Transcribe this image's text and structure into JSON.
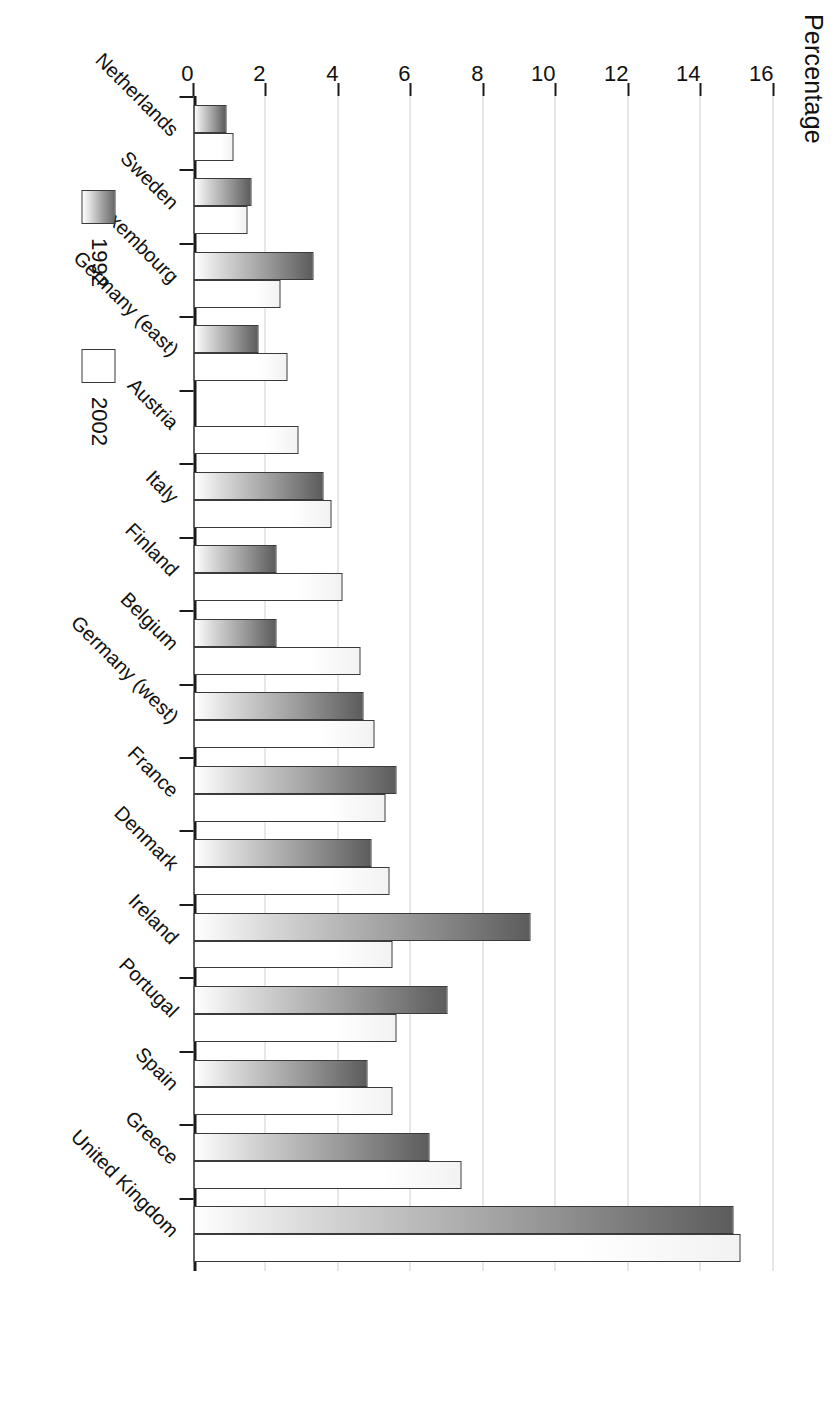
{
  "chart_data": {
    "type": "bar",
    "orientation": "horizontal",
    "title": "",
    "xlabel": "",
    "ylabel": "Percentage",
    "value_axis_title": "Percentage",
    "ylim": [
      0,
      16
    ],
    "tick_values": [
      0,
      2,
      4,
      6,
      8,
      10,
      12,
      14,
      16
    ],
    "tick_labels": [
      "0",
      "2",
      "4",
      "6",
      "8",
      "10",
      "12",
      "14",
      "16"
    ],
    "grid": true,
    "grid_axis": "value",
    "legend_position": "bottom-left",
    "categories": [
      "Netherlands",
      "Sweden",
      "Luxembourg",
      "Germany (east)",
      "Austria",
      "Italy",
      "Finland",
      "Belgium",
      "Germany (west)",
      "France",
      "Denmark",
      "Ireland",
      "Portugal",
      "Spain",
      "Greece",
      "United Kingdom"
    ],
    "series": [
      {
        "name": "2002",
        "color": "#ffffff",
        "values": [
          1.1,
          1.5,
          2.4,
          2.6,
          2.9,
          3.8,
          4.1,
          4.6,
          5.0,
          5.3,
          5.4,
          5.5,
          5.6,
          5.5,
          7.4,
          15.1
        ]
      },
      {
        "name": "1992",
        "color": "#8a8a8a",
        "values": [
          0.9,
          1.6,
          3.3,
          1.8,
          null,
          3.6,
          2.3,
          2.3,
          4.7,
          5.6,
          4.9,
          9.3,
          7.0,
          4.8,
          6.5,
          14.9
        ]
      }
    ]
  },
  "legend": {
    "items": [
      {
        "label": "1992",
        "swatch": "gradient-gray-swatch"
      },
      {
        "label": "2002",
        "swatch": "white-swatch"
      }
    ]
  }
}
